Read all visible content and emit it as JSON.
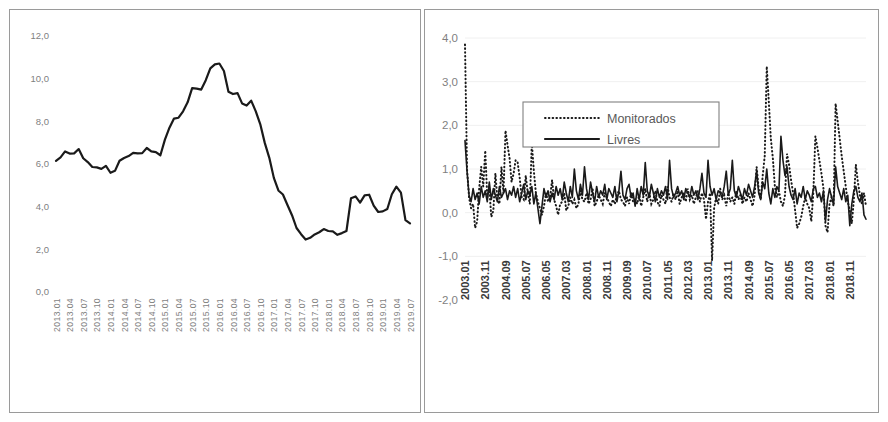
{
  "figure": {
    "panels": [
      "left",
      "right"
    ],
    "background": "#ffffff",
    "border_color": "#9a9a9a",
    "line_color": "#1a1a1a",
    "label_color": "#7f7f7f"
  },
  "chart_data": [
    {
      "id": "left-chart",
      "type": "line",
      "title": "",
      "xlabel": "",
      "ylabel": "",
      "ylim": [
        0,
        12
      ],
      "ytick_labels": [
        "0,0",
        "2,0",
        "4,0",
        "6,0",
        "8,0",
        "10,0",
        "12,0"
      ],
      "yticks": [
        0,
        2,
        4,
        6,
        8,
        10,
        12
      ],
      "grid": false,
      "legend": null,
      "xtick_labels": [
        "2013.01",
        "2013.04",
        "2013.07",
        "2013.10",
        "2014.01",
        "2014.04",
        "2014.07",
        "2014.10",
        "2015.01",
        "2015.04",
        "2015.07",
        "2015.10",
        "2016.01",
        "2016.04",
        "2016.07",
        "2016.10",
        "2017.01",
        "2017.04",
        "2017.07",
        "2017.10",
        "2018.01",
        "2018.04",
        "2018.07",
        "2018.10",
        "2019.01",
        "2019.04",
        "2019.07"
      ],
      "x": [
        "2013.01",
        "2013.02",
        "2013.03",
        "2013.04",
        "2013.05",
        "2013.06",
        "2013.07",
        "2013.08",
        "2013.09",
        "2013.10",
        "2013.11",
        "2013.12",
        "2014.01",
        "2014.02",
        "2014.03",
        "2014.04",
        "2014.05",
        "2014.06",
        "2014.07",
        "2014.08",
        "2014.09",
        "2014.10",
        "2014.11",
        "2014.12",
        "2015.01",
        "2015.02",
        "2015.03",
        "2015.04",
        "2015.05",
        "2015.06",
        "2015.07",
        "2015.08",
        "2015.09",
        "2015.10",
        "2015.11",
        "2015.12",
        "2016.01",
        "2016.02",
        "2016.03",
        "2016.04",
        "2016.05",
        "2016.06",
        "2016.07",
        "2016.08",
        "2016.09",
        "2016.10",
        "2016.11",
        "2016.12",
        "2017.01",
        "2017.02",
        "2017.03",
        "2017.04",
        "2017.05",
        "2017.06",
        "2017.07",
        "2017.08",
        "2017.09",
        "2017.10",
        "2017.11",
        "2017.12",
        "2018.01",
        "2018.02",
        "2018.03",
        "2018.04",
        "2018.05",
        "2018.06",
        "2018.07",
        "2018.08",
        "2018.09",
        "2018.10",
        "2018.11",
        "2018.12",
        "2019.01",
        "2019.02",
        "2019.03",
        "2019.04",
        "2019.05",
        "2019.06",
        "2019.07"
      ],
      "series": [
        {
          "name": "IPCA acumulado 12 meses",
          "style": "solid",
          "values": [
            6.15,
            6.31,
            6.59,
            6.49,
            6.5,
            6.7,
            6.27,
            6.09,
            5.86,
            5.84,
            5.77,
            5.91,
            5.59,
            5.68,
            6.15,
            6.28,
            6.37,
            6.52,
            6.5,
            6.51,
            6.75,
            6.59,
            6.56,
            6.41,
            7.14,
            7.7,
            8.13,
            8.17,
            8.47,
            8.89,
            9.56,
            9.53,
            9.49,
            9.93,
            10.48,
            10.67,
            10.71,
            10.36,
            9.39,
            9.28,
            9.32,
            8.84,
            8.74,
            8.97,
            8.48,
            7.87,
            6.99,
            6.29,
            5.35,
            4.76,
            4.57,
            4.08,
            3.6,
            3.0,
            2.71,
            2.46,
            2.54,
            2.7,
            2.8,
            2.95,
            2.86,
            2.84,
            2.68,
            2.76,
            2.86,
            4.39,
            4.48,
            4.19,
            4.53,
            4.56,
            4.05,
            3.75,
            3.78,
            3.89,
            4.58,
            4.94,
            4.66,
            3.37,
            3.22
          ]
        }
      ]
    },
    {
      "id": "right-chart",
      "type": "line",
      "title": "",
      "xlabel": "",
      "ylabel": "",
      "ylim": [
        -2,
        4
      ],
      "ytick_labels": [
        "-2,0",
        "-1,0",
        "0,0",
        "1,0",
        "2,0",
        "3,0",
        "4,0"
      ],
      "yticks": [
        -2,
        -1,
        0,
        1,
        2,
        3,
        4
      ],
      "grid": true,
      "legend": {
        "position": "top-left-inset",
        "entries": [
          {
            "label": "Monitorados",
            "style": "dotted"
          },
          {
            "label": "Livres",
            "style": "solid"
          }
        ]
      },
      "xtick_labels": [
        "2003.01",
        "2003.11",
        "2004.09",
        "2005.07",
        "2006.05",
        "2007.03",
        "2008.01",
        "2008.11",
        "2009.09",
        "2010.07",
        "2011.05",
        "2012.03",
        "2013.01",
        "2013.11",
        "2014.09",
        "2015.07",
        "2016.05",
        "2017.03",
        "2018.01",
        "2018.11"
      ],
      "x_start": "2003.01",
      "x_end": "2019.07",
      "n_points": 199,
      "series": [
        {
          "name": "Monitorados",
          "style": "dotted",
          "values": [
            3.85,
            1.0,
            0.35,
            0.1,
            0.2,
            -0.35,
            -0.2,
            0.55,
            1.05,
            0.6,
            1.42,
            0.35,
            0.55,
            -0.1,
            0.05,
            0.9,
            0.3,
            0.2,
            1.05,
            0.45,
            1.88,
            1.55,
            1.25,
            0.7,
            0.9,
            1.2,
            1.15,
            0.8,
            0.35,
            0.3,
            0.85,
            0.45,
            0.2,
            1.6,
            0.95,
            0.45,
            0.25,
            0.1,
            -0.05,
            0.15,
            0.45,
            0.25,
            0.35,
            0.75,
            0.3,
            0.15,
            -0.05,
            0.2,
            0.25,
            0.45,
            0.05,
            0.15,
            0.35,
            0.2,
            0.3,
            0.1,
            0.2,
            0.5,
            0.3,
            0.25,
            0.45,
            0.2,
            0.3,
            0.55,
            0.15,
            0.25,
            0.4,
            0.3,
            0.2,
            0.45,
            0.35,
            0.25,
            0.15,
            0.3,
            0.2,
            0.4,
            0.5,
            0.3,
            0.25,
            0.15,
            0.35,
            0.2,
            0.45,
            0.25,
            0.3,
            0.2,
            0.4,
            0.15,
            0.35,
            0.55,
            0.25,
            0.45,
            0.2,
            0.3,
            0.5,
            0.25,
            0.15,
            0.4,
            0.3,
            0.2,
            0.6,
            0.35,
            0.25,
            0.45,
            0.3,
            0.5,
            0.2,
            0.35,
            0.45,
            0.25,
            0.55,
            0.3,
            0.4,
            0.2,
            0.35,
            0.5,
            0.25,
            0.45,
            0.3,
            -0.15,
            0.25,
            0.45,
            -1.1,
            0.1,
            0.35,
            0.2,
            0.55,
            0.3,
            0.4,
            0.15,
            0.45,
            0.25,
            0.35,
            0.2,
            0.5,
            0.3,
            0.4,
            0.2,
            0.35,
            0.25,
            0.45,
            0.3,
            0.15,
            0.4,
            1.05,
            0.55,
            0.3,
            0.85,
            1.3,
            3.35,
            2.55,
            1.7,
            1.25,
            0.6,
            0.35,
            0.5,
            0.25,
            0.15,
            0.4,
            1.35,
            1.1,
            0.75,
            0.45,
            0.05,
            -0.35,
            -0.25,
            -0.1,
            0.15,
            0.35,
            0.2,
            0.1,
            -0.2,
            0.45,
            1.75,
            1.5,
            1.2,
            0.9,
            0.55,
            -0.3,
            -0.45,
            0.2,
            0.35,
            0.15,
            2.5,
            2.1,
            1.7,
            1.3,
            0.95,
            0.6,
            0.25,
            0.05,
            -0.25,
            0.3,
            1.1,
            0.7,
            0.4,
            0.2,
            0.45,
            0.15
          ]
        },
        {
          "name": "Livres",
          "style": "solid",
          "values": [
            1.65,
            0.95,
            0.4,
            0.25,
            0.55,
            0.3,
            0.45,
            0.2,
            0.6,
            0.35,
            0.5,
            0.25,
            0.7,
            0.3,
            0.55,
            0.4,
            0.25,
            0.6,
            0.35,
            0.45,
            0.55,
            0.3,
            0.5,
            0.4,
            0.6,
            0.35,
            0.55,
            0.25,
            0.45,
            0.65,
            0.3,
            0.5,
            0.4,
            0.6,
            0.2,
            0.45,
            0.1,
            -0.25,
            0.15,
            0.55,
            0.35,
            0.5,
            0.25,
            0.45,
            0.3,
            0.6,
            0.4,
            0.55,
            0.3,
            0.7,
            0.45,
            0.25,
            0.6,
            0.35,
            1.0,
            0.5,
            0.3,
            0.65,
            0.4,
            1.05,
            0.55,
            0.3,
            0.7,
            0.45,
            0.25,
            0.6,
            0.35,
            0.5,
            0.4,
            0.65,
            0.3,
            0.55,
            0.45,
            0.35,
            0.6,
            0.25,
            0.5,
            0.95,
            0.4,
            0.3,
            0.55,
            0.65,
            0.35,
            0.45,
            0.15,
            0.55,
            0.3,
            0.6,
            0.4,
            1.15,
            0.5,
            0.35,
            0.65,
            0.45,
            0.25,
            0.55,
            0.35,
            0.5,
            0.4,
            0.6,
            0.3,
            1.2,
            0.55,
            0.35,
            0.45,
            0.6,
            0.4,
            0.5,
            0.3,
            0.55,
            0.45,
            0.35,
            0.6,
            0.4,
            0.5,
            0.3,
            0.55,
            0.9,
            0.45,
            0.35,
            1.2,
            0.6,
            0.4,
            0.55,
            0.3,
            0.5,
            0.45,
            0.35,
            0.6,
            0.95,
            0.4,
            0.55,
            1.2,
            0.5,
            0.35,
            0.6,
            0.45,
            0.3,
            0.55,
            0.4,
            0.65,
            0.5,
            0.35,
            0.6,
            0.95,
            0.45,
            0.3,
            0.7,
            0.55,
            1.0,
            0.45,
            0.2,
            0.55,
            0.35,
            0.6,
            0.5,
            1.75,
            1.2,
            0.85,
            1.05,
            0.6,
            0.4,
            0.3,
            0.55,
            0.2,
            0.45,
            0.35,
            0.6,
            0.3,
            0.5,
            0.4,
            0.25,
            0.55,
            0.6,
            0.35,
            0.45,
            0.25,
            0.5,
            -0.2,
            0.3,
            0.55,
            0.35,
            0.2,
            1.05,
            0.6,
            0.45,
            0.3,
            0.55,
            0.25,
            0.4,
            -0.3,
            0.2,
            0.5,
            0.6,
            0.35,
            0.25,
            0.45,
            -0.05,
            -0.15
          ]
        }
      ]
    }
  ]
}
